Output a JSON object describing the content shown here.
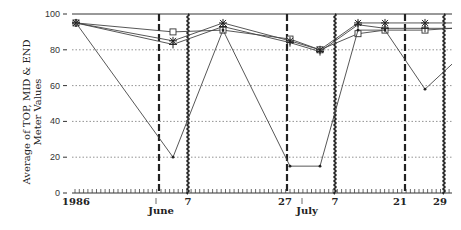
{
  "chart_data": {
    "type": "line",
    "title": "",
    "ylabel": "Average of TOP, MID & END Meter Values",
    "ylabel_lines": [
      "Average of TOP, MID & END",
      "Meter Values"
    ],
    "xlabel": "",
    "ylim": [
      0,
      100
    ],
    "y_ticks": [
      0,
      20,
      40,
      60,
      80,
      100
    ],
    "grid": "horizontal dotted",
    "x_tick_labels": [
      {
        "label": "1986",
        "x": 76
      },
      {
        "label": "June",
        "x": 161
      },
      {
        "label": "7",
        "x": 188
      },
      {
        "label": "27",
        "x": 285
      },
      {
        "label": "July",
        "x": 307
      },
      {
        "label": "7",
        "x": 335
      },
      {
        "label": "21",
        "x": 400
      },
      {
        "label": "29",
        "x": 440
      }
    ],
    "vertical_markers": [
      {
        "style": "dashed",
        "x": 159,
        "label": "June 1"
      },
      {
        "style": "wavy",
        "x": 188,
        "label": "June 7"
      },
      {
        "style": "dashed",
        "x": 287,
        "label": "June 27"
      },
      {
        "style": "wavy",
        "x": 335,
        "label": "July 7"
      },
      {
        "style": "dashed",
        "x": 405,
        "label": "July 21"
      },
      {
        "style": "wavy",
        "x": 444,
        "label": "July 29"
      }
    ],
    "x": [
      76,
      173,
      223,
      290,
      320,
      358,
      385,
      425,
      452
    ],
    "series": [
      {
        "name": "square",
        "marker": "square",
        "values": [
          95,
          90,
          91,
          86,
          80,
          89,
          91,
          91,
          92
        ]
      },
      {
        "name": "asterisk",
        "marker": "asterisk",
        "values": [
          95,
          85,
          95,
          85,
          80,
          95,
          95,
          95,
          95
        ]
      },
      {
        "name": "plus",
        "marker": "plus",
        "values": [
          95,
          83,
          93,
          84,
          79,
          94,
          92,
          92,
          92
        ]
      },
      {
        "name": "dot",
        "marker": "dot",
        "values": [
          95,
          20,
          91,
          15,
          15,
          91,
          91,
          58,
          72
        ]
      }
    ],
    "reference_line": 100
  }
}
